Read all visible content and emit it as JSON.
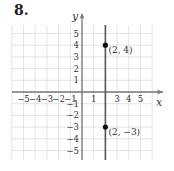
{
  "problem_number": "8.",
  "chart_data": {
    "type": "line",
    "title": "",
    "xlabel": "x",
    "ylabel": "y",
    "xlim": [
      -6,
      6
    ],
    "ylim": [
      -6,
      5.7
    ],
    "grid": true,
    "x_ticks": [
      "-5",
      "-4",
      "-3",
      "-2",
      "-1",
      "1",
      "3",
      "4",
      "5"
    ],
    "y_ticks": [
      "5",
      "4",
      "3",
      "2",
      "1",
      "-1",
      "-2",
      "-3",
      "-4",
      "-5"
    ],
    "series": [
      {
        "name": "x = 2",
        "kind": "vertical-line",
        "x": 2
      }
    ],
    "points": [
      {
        "x": 2,
        "y": 4,
        "label": "(2, 4)"
      },
      {
        "x": 2,
        "y": -3,
        "label": "(2, −3)"
      }
    ],
    "colors": {
      "grid": "#d8d8d8",
      "axis": "#777777",
      "line": "#555555",
      "point": "#111111"
    }
  }
}
